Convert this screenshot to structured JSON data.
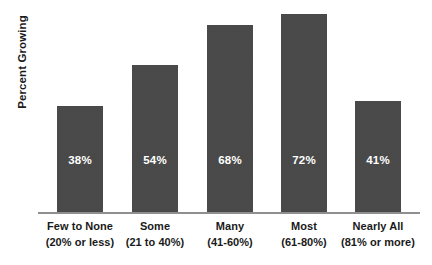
{
  "chart_data": {
    "type": "bar",
    "title": "",
    "subtitle": "",
    "xlabel": "",
    "ylabel": "Percent Growing",
    "ylim": [
      0,
      80
    ],
    "grid": false,
    "legend": false,
    "orientation": "vertical",
    "bar_color": "#464646",
    "value_label_color": "#ffffff",
    "axis_line_color": "#8f8f8f",
    "background_color": "#ffffff",
    "categories": [
      "Few to None (20% or less)",
      "Some (21 to 40%)",
      "Many (41-60%)",
      "Most (61-80%)",
      "Nearly All (81% or more)"
    ],
    "values": [
      38,
      54,
      68,
      72,
      41
    ],
    "value_labels": [
      "38%",
      "54%",
      "68%",
      "72%",
      "41%"
    ],
    "category_lines": [
      {
        "line1": "Few to None",
        "line2": "(20% or less)"
      },
      {
        "line1": "Some",
        "line2": "(21 to 40%)"
      },
      {
        "line1": "Many",
        "line2": "(41-60%)"
      },
      {
        "line1": "Most",
        "line2": "(61-80%)"
      },
      {
        "line1": "Nearly All",
        "line2": "(81% or more)"
      }
    ]
  },
  "axis": {
    "y_title": "Percent Growing"
  },
  "bars": [
    {
      "value_label": "38%",
      "left": 57,
      "width": 46,
      "height": 107
    },
    {
      "value_label": "54%",
      "left": 132,
      "width": 46,
      "height": 148
    },
    {
      "value_label": "68%",
      "left": 207,
      "width": 46,
      "height": 188
    },
    {
      "value_label": "72%",
      "left": 281,
      "width": 46,
      "height": 199
    },
    {
      "value_label": "41%",
      "left": 355,
      "width": 46,
      "height": 112
    }
  ],
  "labels": [
    {
      "line1": "Few to None",
      "line2": "(20% or less)",
      "center": 80
    },
    {
      "line1": "Some",
      "line2": "(21 to 40%)",
      "center": 155
    },
    {
      "line1": "Many",
      "line2": "(41-60%)",
      "center": 230
    },
    {
      "line1": "Most",
      "line2": "(61-80%)",
      "center": 304
    },
    {
      "line1": "Nearly All",
      "line2": "(81% or more)",
      "center": 378
    }
  ]
}
